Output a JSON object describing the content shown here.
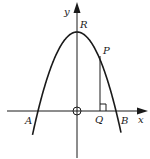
{
  "diagram": {
    "type": "parabola-on-axes",
    "axes": {
      "x_label": "x",
      "y_label": "y"
    },
    "points": {
      "R": "R",
      "P": "P",
      "Q": "Q",
      "A": "A",
      "B": "B"
    },
    "origin_marker": "circle",
    "right_angle_at": "Q",
    "colors": {
      "ink": "#1a1a1a",
      "background": "#ffffff"
    }
  }
}
